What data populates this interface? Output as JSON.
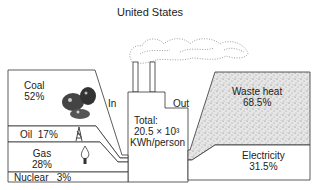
{
  "title": "United States",
  "inputs": [
    {
      "name": "Coal",
      "percent": "52%"
    },
    {
      "name": "Oil",
      "percent": "17%"
    },
    {
      "name": "Gas",
      "percent": "28%"
    },
    {
      "name": "Nuclear",
      "percent": "3%"
    }
  ],
  "plant": {
    "in_label": "In",
    "out_label": "Out",
    "total_line1": "Total:",
    "total_line2": "20.5 × 10³",
    "total_line3": "KWh/person"
  },
  "outputs": [
    {
      "name": "Waste heat",
      "percent": "68.5%"
    },
    {
      "name": "Electricity",
      "percent": "31.5%"
    }
  ],
  "icons": [
    "coal-lump-icon",
    "oil-derrick-icon",
    "gas-flame-icon",
    "smoke-cloud-icon"
  ]
}
